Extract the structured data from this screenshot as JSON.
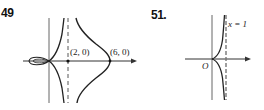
{
  "figures": [
    {
      "number": "49",
      "labels": {
        "point_a": "(2, 0)",
        "point_b": "(6, 0)"
      },
      "elements": [
        "x-axis",
        "y-axis",
        "dashed-asymptote-x-2",
        "loop-left-of-origin",
        "branches-near-asymptote",
        "outer-bell-curve"
      ]
    },
    {
      "number": "51.",
      "labels": {
        "asymptote": "x = 1",
        "origin": "O"
      },
      "elements": [
        "x-axis",
        "y-axis",
        "dashed-asymptote-x-1",
        "cusp-at-origin"
      ]
    }
  ]
}
